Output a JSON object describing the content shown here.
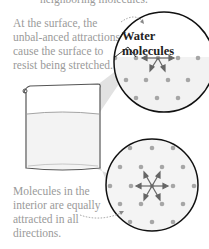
{
  "captions": {
    "top_cut": "neighboring molecules.",
    "surface": "At the surface, the unbal-anced attractions cause the surface to resist being stretched.",
    "interior": "Molecules in the interior are equally attracted in all directions."
  },
  "labels": {
    "water_molecules": "Water molecules"
  },
  "colors": {
    "caption_text": "#9a9a9a",
    "molecule_dot": "#a6a6a6",
    "circle_outline": "#111111",
    "beam_shade": "#d9d9d9",
    "beaker_outline": "#555555",
    "arrow": "#666666"
  }
}
